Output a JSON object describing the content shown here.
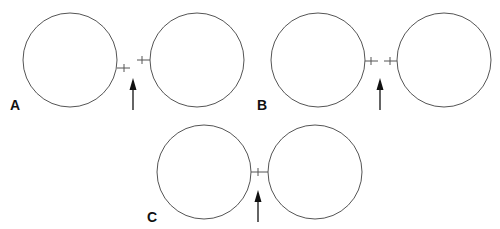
{
  "figure": {
    "panels": [
      {
        "label": "A"
      },
      {
        "label": "B"
      },
      {
        "label": "C"
      }
    ]
  },
  "colors": {
    "stroke": "#555555",
    "arrow": "#111111",
    "background": "#ffffff"
  }
}
